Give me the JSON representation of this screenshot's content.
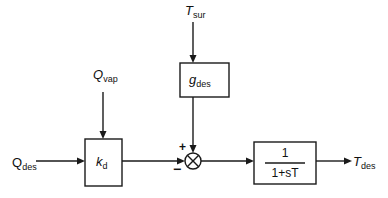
{
  "diagram": {
    "type": "control-block-diagram",
    "inputs": {
      "q_des": {
        "main": "Q",
        "sub": "des"
      },
      "q_vap": {
        "main": "Q",
        "sub": "vap"
      },
      "t_sur": {
        "main": "T",
        "sub": "sur"
      }
    },
    "blocks": {
      "kd": {
        "main": "k",
        "sub": "d"
      },
      "gdes": {
        "main": "g",
        "sub": "des"
      },
      "transfer": {
        "numerator": "1",
        "denominator": "1+sT"
      }
    },
    "summing_junction": {
      "plus": "+",
      "minus": "−"
    },
    "output": {
      "t_des": {
        "main": "T",
        "sub": "des"
      }
    }
  }
}
